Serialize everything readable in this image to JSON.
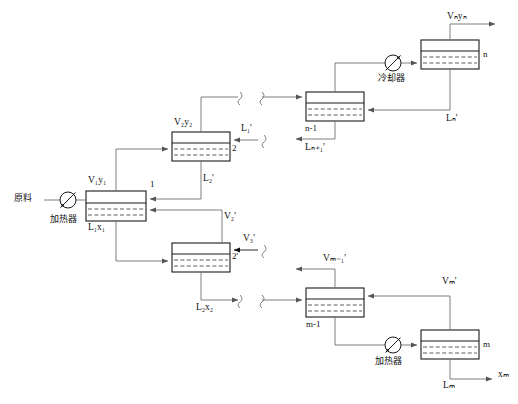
{
  "diagram": {
    "feed_label": "原料",
    "heater_label_left": "加热器",
    "cooler_label": "冷却器",
    "heater_label_right": "加热器",
    "stage_numbers": {
      "s1": "1",
      "s2": "2",
      "s2p": "2'",
      "sn_minus_1": "n-1",
      "sn": "n",
      "sm_minus_1": "m-1",
      "sm": "m"
    },
    "streams": {
      "v1y1": "V₁y₁",
      "l1x1": "L₁x₁",
      "v2y2": "V₂y₂",
      "l1p": "L₁'",
      "l2p": "L₂'",
      "v2p": "V₂'",
      "v3p": "V₃'",
      "l2x2": "L₂x₂",
      "vnyn": "Vₙyₙ",
      "lnp": "Lₙ'",
      "lnp1": "Lₙ₊₁'",
      "vmp": "Vₘ'",
      "vm1p": "Vₘ₋₁'",
      "lm": "Lₘ",
      "xm": "xₘ"
    },
    "icons": {
      "heater": "heater-valve-icon",
      "cooler": "cooler-valve-icon",
      "break": "line-break-squiggle-icon",
      "arrow": "flow-arrow-icon"
    },
    "colors": {
      "line": "#6f6f6f",
      "box_border": "#1a1a1a",
      "dashed": "#4a4a4a",
      "text": "#111111",
      "background": "#ffffff"
    }
  }
}
